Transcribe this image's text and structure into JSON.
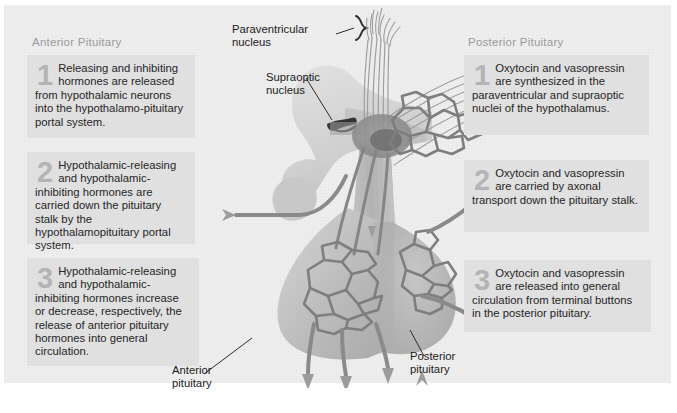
{
  "figure": {
    "title_alt": "Hypothalamic control of the anterior and posterior pituitary",
    "background_color": "#eeeeee",
    "box_color": "#e0e0e0",
    "numeral_color": "#b4b4b4",
    "heading_color": "#9b9b9b",
    "text_color": "#262626"
  },
  "columns": {
    "anterior": {
      "heading": "Anterior Pituitary",
      "steps": [
        {
          "number": "1",
          "text": "Releasing and inhibiting hormones are released from hypothalamic neurons into the hypothalamo-pituitary portal system."
        },
        {
          "number": "2",
          "text": "Hypothalamic-releasing and hypothalamic-inhibiting hormones are carried down the pituitary stalk by the hypothalamopituitary portal system."
        },
        {
          "number": "3",
          "text": "Hypothalamic-releasing and hypothalamic-inhibiting hormones increase or decrease, respectively, the release of anterior pituitary hormones into general circulation."
        }
      ]
    },
    "posterior": {
      "heading": "Posterior Pituitary",
      "steps": [
        {
          "number": "1",
          "text": "Oxytocin and vasopressin are synthesized in the paraventricular and supraoptic nuclei of the hypothalamus."
        },
        {
          "number": "2",
          "text": "Oxytocin and vasopressin are carried by axonal transport down the pituitary stalk."
        },
        {
          "number": "3",
          "text": "Oxytocin and vasopressin are released into general circulation from terminal buttons in the posterior pituitary."
        }
      ]
    }
  },
  "callouts": {
    "paraventricular_nucleus": "Paraventricular\nnucleus",
    "paraventricular_line1": "Paraventricular",
    "paraventricular_line2": "nucleus",
    "supraoptic_line1": "Supraoptic",
    "supraoptic_line2": "nucleus",
    "anterior_pituitary_line1": "Anterior",
    "anterior_pituitary_line2": "pituitary",
    "posterior_pituitary_line1": "Posterior",
    "posterior_pituitary_line2": "pituitary"
  },
  "artwork": {
    "description": "Mid-sagittal drawing of the hypothalamus, pituitary stalk and pituitary gland showing the hypophyseal portal capillary beds and the hypothalamo-hypophyseal neural tract",
    "tissue_color": "#b9b9b9",
    "vessel_color": "#8a8a8a",
    "nerve_color": "#9a9a9a",
    "arrow_color": "#9c9c9c"
  }
}
